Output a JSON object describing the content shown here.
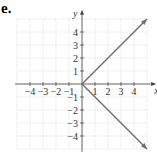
{
  "label": "e.",
  "chart_data": {
    "type": "line",
    "title": "",
    "xlabel": "x",
    "ylabel": "y",
    "xlim": [
      -5,
      5.5
    ],
    "ylim": [
      -5,
      5.5
    ],
    "grid": true,
    "x_ticks": [
      -4,
      -3,
      -2,
      -1,
      1,
      2,
      3,
      4
    ],
    "y_ticks": [
      -4,
      -3,
      -2,
      -1,
      1,
      2,
      3,
      4
    ],
    "series": [
      {
        "name": "upper ray",
        "x": [
          0,
          5
        ],
        "y": [
          0,
          5
        ],
        "arrow_end": true
      },
      {
        "name": "lower ray",
        "x": [
          0,
          5
        ],
        "y": [
          0,
          -5
        ],
        "arrow_end": true
      }
    ],
    "colors": {
      "line": "#707070",
      "grid": "#d8d8d8",
      "axis": "#444444"
    }
  }
}
